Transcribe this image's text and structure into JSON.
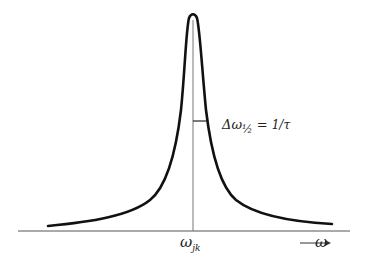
{
  "diagram": {
    "type": "lorentzian-line-shape",
    "curve": {
      "description": "Sharply peaked symmetric resonance curve",
      "center_x": 193,
      "peak_y": 15,
      "baseline_y": 226,
      "color": "#111111"
    },
    "axis": {
      "label": "ω",
      "arrow": "⟶",
      "color": "#555555"
    },
    "center_line": {
      "label_main": "ω",
      "label_sub": "jk",
      "color": "#555555"
    },
    "half_width": {
      "label_main": "Δω",
      "label_sub": "½",
      "equals": "=",
      "frac_num": "1",
      "frac_den": "τ"
    }
  }
}
